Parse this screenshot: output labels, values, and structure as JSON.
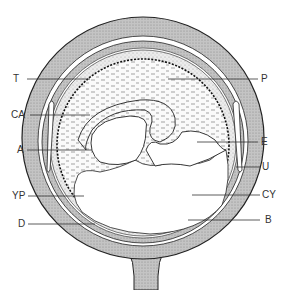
{
  "figure": {
    "type": "anatomical cross-section diagram",
    "labels_left": [
      {
        "id": "T",
        "text": "T"
      },
      {
        "id": "CA",
        "text": "CA"
      },
      {
        "id": "A",
        "text": "A"
      },
      {
        "id": "YP",
        "text": "YP"
      },
      {
        "id": "D",
        "text": "D"
      }
    ],
    "labels_right": [
      {
        "id": "P",
        "text": "P"
      },
      {
        "id": "E",
        "text": "E"
      },
      {
        "id": "U",
        "text": "U"
      },
      {
        "id": "CY",
        "text": "CY"
      },
      {
        "id": "B",
        "text": "B"
      }
    ],
    "colors": {
      "outer_wall": "#b5b5b5",
      "stipple_layer": "#d6d6d6",
      "line": "#222222",
      "background": "#ffffff"
    }
  }
}
